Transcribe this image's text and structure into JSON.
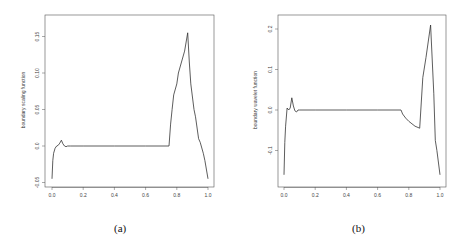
{
  "chart_data": [
    {
      "type": "line",
      "panel_caption": "(a)",
      "title": "",
      "xlabel": "",
      "ylabel": "boundary scaling function",
      "xlim": [
        0.0,
        1.0
      ],
      "ylim": [
        -0.05,
        0.17
      ],
      "xticks": [
        "0.0",
        "0.2",
        "0.4",
        "0.6",
        "0.8",
        "1.0"
      ],
      "yticks": [
        "-0.05",
        "0.0",
        "0.05",
        "0.10",
        "0.15"
      ],
      "grid": false,
      "legend": null,
      "series": [
        {
          "name": "boundary scaling function",
          "x": [
            0.0,
            0.005,
            0.01,
            0.02,
            0.03,
            0.04,
            0.05,
            0.06,
            0.07,
            0.08,
            0.09,
            0.1,
            0.12,
            0.2,
            0.4,
            0.6,
            0.75,
            0.76,
            0.77,
            0.78,
            0.8,
            0.81,
            0.83,
            0.85,
            0.87,
            0.88,
            0.89,
            0.91,
            0.92,
            0.94,
            0.95,
            0.97,
            0.98,
            1.0
          ],
          "y": [
            -0.045,
            -0.02,
            -0.01,
            -0.003,
            0.0,
            0.001,
            0.004,
            0.008,
            0.003,
            0.0,
            -0.001,
            0.0,
            0.0,
            0.0,
            0.0,
            0.0,
            0.0,
            0.03,
            0.05,
            0.07,
            0.085,
            0.1,
            0.115,
            0.13,
            0.155,
            0.115,
            0.085,
            0.05,
            0.04,
            0.01,
            0.005,
            -0.01,
            -0.02,
            -0.045
          ]
        }
      ]
    },
    {
      "type": "line",
      "panel_caption": "(b)",
      "title": "",
      "xlabel": "",
      "ylabel": "boundary wavelet function",
      "xlim": [
        0.0,
        1.0
      ],
      "ylim": [
        -0.18,
        0.22
      ],
      "xticks": [
        "0.0",
        "0.2",
        "0.4",
        "0.6",
        "0.8",
        "1.0"
      ],
      "yticks": [
        "-0.1",
        "0.0",
        "0.1",
        "0.2"
      ],
      "grid": false,
      "legend": null,
      "series": [
        {
          "name": "boundary wavelet function",
          "x": [
            0.0,
            0.005,
            0.01,
            0.02,
            0.03,
            0.04,
            0.05,
            0.06,
            0.07,
            0.08,
            0.09,
            0.1,
            0.2,
            0.4,
            0.6,
            0.75,
            0.76,
            0.78,
            0.8,
            0.84,
            0.87,
            0.89,
            0.91,
            0.94,
            0.96,
            0.97,
            0.98,
            1.0
          ],
          "y": [
            -0.16,
            -0.08,
            -0.04,
            0.005,
            0.0,
            0.005,
            0.03,
            0.01,
            -0.002,
            -0.005,
            0.0,
            0.0,
            0.0,
            0.0,
            0.0,
            0.0,
            -0.01,
            -0.02,
            -0.028,
            -0.04,
            -0.045,
            0.08,
            0.13,
            0.21,
            0.04,
            -0.075,
            -0.1,
            -0.16
          ]
        }
      ]
    }
  ],
  "panels": {
    "a": {
      "caption": "(a)",
      "ylabel": "boundary scaling function"
    },
    "b": {
      "caption": "(b)",
      "ylabel": "boundary wavelet function"
    }
  }
}
